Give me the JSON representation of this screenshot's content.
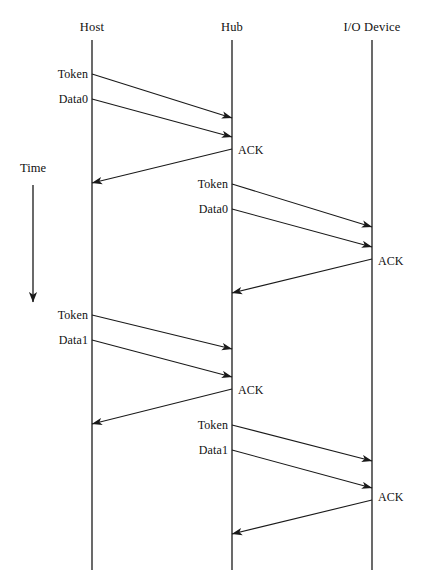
{
  "figure": {
    "type": "sequence-diagram",
    "title": "",
    "background_color": "#ffffff",
    "line_color": "#1a1a1a",
    "lifeline_color": "#2b2b2b",
    "width": 425,
    "height": 585
  },
  "time_axis": {
    "label": "Time",
    "label_x": 33,
    "label_y": 168,
    "arrow_x": 33,
    "arrow_top_y": 185,
    "arrow_bottom_y": 302,
    "direction": "down"
  },
  "lifelines": [
    {
      "id": "host",
      "label": "Host",
      "x": 92,
      "header_y": 27,
      "top_y": 40,
      "bottom_y": 570
    },
    {
      "id": "hub",
      "label": "Hub",
      "x": 232,
      "header_y": 27,
      "top_y": 40,
      "bottom_y": 570
    },
    {
      "id": "device",
      "label": "I/O Device",
      "x": 372,
      "header_y": 27,
      "top_y": 40,
      "bottom_y": 570
    }
  ],
  "messages": [
    {
      "id": "m1",
      "label": "Token",
      "from": "host",
      "to": "hub",
      "x1": 92,
      "y1": 74,
      "x2": 232,
      "y2": 118,
      "label_x": 88,
      "label_y": 74,
      "label_side": "left",
      "arrowhead": true
    },
    {
      "id": "m2",
      "label": "Data0",
      "from": "host",
      "to": "hub",
      "x1": 92,
      "y1": 99,
      "x2": 232,
      "y2": 137,
      "label_x": 88,
      "label_y": 99,
      "label_side": "left",
      "arrowhead": true
    },
    {
      "id": "m3",
      "label": "ACK",
      "from": "hub",
      "to": "host",
      "x1": 232,
      "y1": 149,
      "x2": 92,
      "y2": 183,
      "label_x": 238,
      "label_y": 150,
      "label_side": "right",
      "arrowhead": true
    },
    {
      "id": "m4",
      "label": "Token",
      "from": "hub",
      "to": "device",
      "x1": 232,
      "y1": 184,
      "x2": 372,
      "y2": 227,
      "label_x": 228,
      "label_y": 184,
      "label_side": "left",
      "arrowhead": true
    },
    {
      "id": "m5",
      "label": "Data0",
      "from": "hub",
      "to": "device",
      "x1": 232,
      "y1": 209,
      "x2": 372,
      "y2": 247,
      "label_x": 228,
      "label_y": 209,
      "label_side": "left",
      "arrowhead": true
    },
    {
      "id": "m6",
      "label": "ACK",
      "from": "device",
      "to": "hub",
      "x1": 372,
      "y1": 259,
      "x2": 232,
      "y2": 293,
      "label_x": 378,
      "label_y": 261,
      "label_side": "right",
      "arrowhead": true
    },
    {
      "id": "m7",
      "label": "Token",
      "from": "host",
      "to": "hub",
      "x1": 92,
      "y1": 315,
      "x2": 232,
      "y2": 349,
      "label_x": 88,
      "label_y": 315,
      "label_side": "left",
      "arrowhead": true
    },
    {
      "id": "m8",
      "label": "Data1",
      "from": "host",
      "to": "hub",
      "x1": 92,
      "y1": 340,
      "x2": 232,
      "y2": 377,
      "label_x": 88,
      "label_y": 340,
      "label_side": "left",
      "arrowhead": true
    },
    {
      "id": "m9",
      "label": "ACK",
      "from": "hub",
      "to": "host",
      "x1": 232,
      "y1": 389,
      "x2": 92,
      "y2": 424,
      "label_x": 238,
      "label_y": 390,
      "label_side": "right",
      "arrowhead": true
    },
    {
      "id": "m10",
      "label": "Token",
      "from": "hub",
      "to": "device",
      "x1": 232,
      "y1": 425,
      "x2": 372,
      "y2": 461,
      "label_x": 228,
      "label_y": 425,
      "label_side": "left",
      "arrowhead": true
    },
    {
      "id": "m11",
      "label": "Data1",
      "from": "hub",
      "to": "device",
      "x1": 232,
      "y1": 450,
      "x2": 372,
      "y2": 488,
      "label_x": 228,
      "label_y": 450,
      "label_side": "left",
      "arrowhead": true
    },
    {
      "id": "m12",
      "label": "ACK",
      "from": "device",
      "to": "hub",
      "x1": 372,
      "y1": 500,
      "x2": 232,
      "y2": 534,
      "label_x": 378,
      "label_y": 497,
      "label_side": "right",
      "arrowhead": true
    }
  ]
}
